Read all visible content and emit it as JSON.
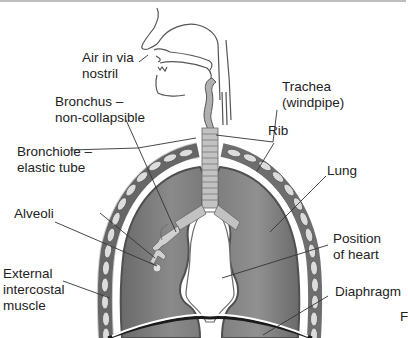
{
  "diagram": {
    "labels": {
      "air_in": "Air in via\nnostril",
      "bronchus": "Bronchus –\nnon-collapsible",
      "bronchiole": "Bronchiole –\nelastic tube",
      "alveoli": "Alveoli",
      "external_intercostal": "External\nintercostal\nmuscle",
      "trachea": "Trachea\n(windpipe)",
      "rib": "Rib",
      "lung": "Lung",
      "heart": "Position\nof heart",
      "diaphragm": "Diaphragm",
      "edge_fragment": "F"
    },
    "colors": {
      "lung_fill": "#7a7a7a",
      "lung_edge": "#5a5a5a",
      "rib_fill": "#6e6e6e",
      "rib_inner": "#dcdcdc",
      "trachea_fill": "#b9b9b9",
      "outline": "#555555",
      "leader_line": "#333333",
      "text": "#222222"
    }
  }
}
